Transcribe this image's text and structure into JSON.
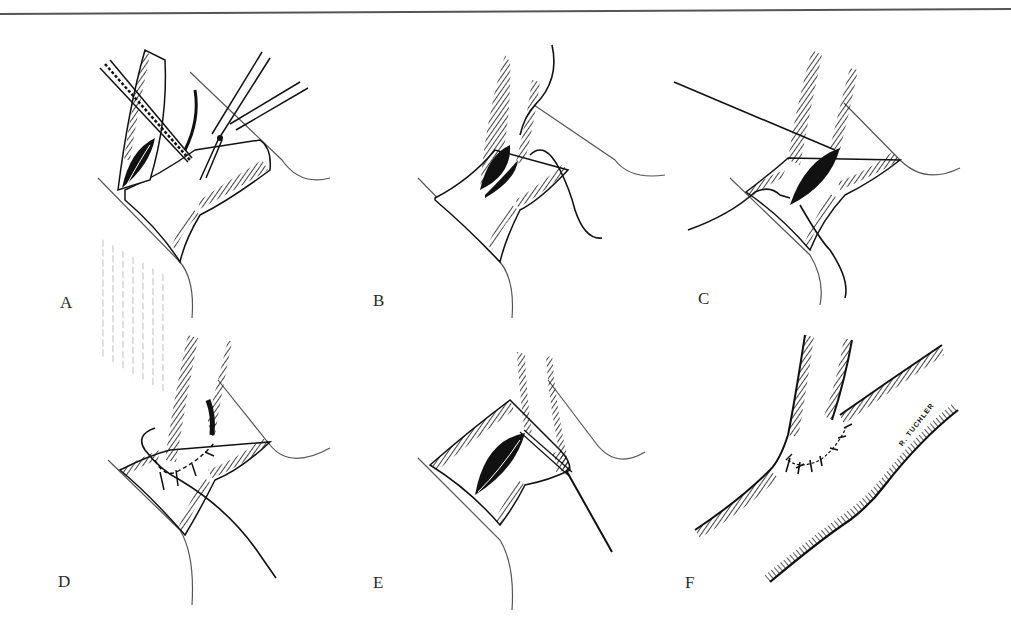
{
  "figure": {
    "colors": {
      "ink": "#111111",
      "hatch": "#1a1a1a",
      "light_hatch": "#9a9a9a",
      "frame": "#555555",
      "background": "#ffffff"
    },
    "panels": [
      {
        "id": "A",
        "label": "A",
        "description": "Forceps and scissors opening the vessel"
      },
      {
        "id": "B",
        "label": "B",
        "description": "Suture placed at incision apex"
      },
      {
        "id": "C",
        "label": "C",
        "description": "Suture lines drawn across the anastomosis"
      },
      {
        "id": "D",
        "label": "D",
        "description": "Posterior wall sutured"
      },
      {
        "id": "E",
        "label": "E",
        "description": "Anterior wall suturing"
      },
      {
        "id": "F",
        "label": "F",
        "description": "Completed end-to-side anastomosis"
      }
    ],
    "signature": "R. TUCHLER"
  }
}
